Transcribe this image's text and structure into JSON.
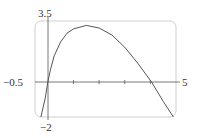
{
  "chart_data": {
    "type": "line",
    "title": "",
    "xlabel": "",
    "ylabel": "",
    "xlim": [
      -0.5,
      5
    ],
    "ylim": [
      -2,
      3.5
    ],
    "grid": false,
    "legend": null,
    "tick_labels": {
      "x_min": "−0.5",
      "x_max": "5",
      "y_max": "3.5",
      "y_min": "−2"
    },
    "x_ticks": [
      1,
      2,
      3,
      4
    ],
    "series": [
      {
        "name": "f(x)",
        "x": [
          -0.27,
          -0.1,
          0,
          0.1,
          0.25,
          0.5,
          0.75,
          1,
          1.5,
          2,
          2.5,
          3,
          3.5,
          4.05,
          4.5,
          4.9
        ],
        "y": [
          -2,
          -0.9,
          0,
          0.7,
          1.5,
          2.3,
          2.8,
          3.05,
          3.25,
          3.1,
          2.7,
          2.0,
          1.1,
          0,
          -1.1,
          -2
        ]
      }
    ],
    "colors": {
      "curve": "#555555",
      "axis": "#555555",
      "frame": "#cfcfcf"
    }
  }
}
